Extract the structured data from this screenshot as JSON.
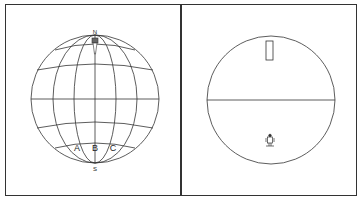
{
  "left_panel": {
    "labels": {
      "north": "N",
      "south": "S",
      "a": "A",
      "b": "B",
      "c": "C"
    }
  },
  "right_panel": {},
  "colors": {
    "line": "#333333",
    "background": "#ffffff"
  }
}
